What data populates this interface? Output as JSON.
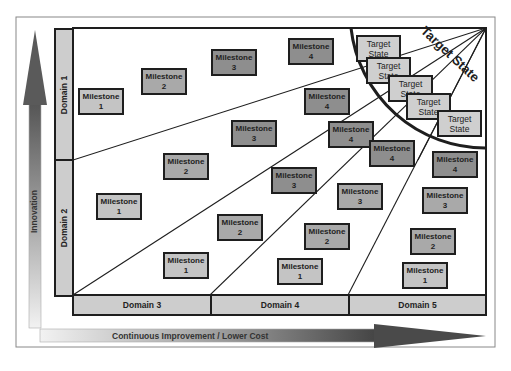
{
  "diagram": {
    "axes": {
      "vertical_label": "Innovation",
      "horizontal_label": "Continuous Improvement / Lower Cost"
    },
    "vertical_domains": [
      {
        "label": "Domain 1"
      },
      {
        "label": "Domain 2"
      }
    ],
    "horizontal_domains": [
      {
        "label": "Domain 3"
      },
      {
        "label": "Domain 4"
      },
      {
        "label": "Domain 5"
      }
    ],
    "target_region_label": "Target State",
    "target_states": [
      {
        "line1": "Target",
        "line2": "State"
      },
      {
        "line1": "Target",
        "line2": "State"
      },
      {
        "line1": "Target",
        "line2": "State"
      },
      {
        "line1": "Target",
        "line2": "State"
      },
      {
        "line1": "Target",
        "line2": "State"
      }
    ],
    "milestones": [
      {
        "label": "Milestone",
        "num": "1"
      },
      {
        "label": "Milestone",
        "num": "2"
      },
      {
        "label": "Milestone",
        "num": "3"
      },
      {
        "label": "Milestone",
        "num": "4"
      },
      {
        "label": "Milestone",
        "num": "4"
      },
      {
        "label": "Milestone",
        "num": "3"
      },
      {
        "label": "Milestone",
        "num": "4"
      },
      {
        "label": "Milestone",
        "num": "4"
      },
      {
        "label": "Milestone",
        "num": "2"
      },
      {
        "label": "Milestone",
        "num": "3"
      },
      {
        "label": "Milestone",
        "num": "3"
      },
      {
        "label": "Milestone",
        "num": "4"
      },
      {
        "label": "Milestone",
        "num": "1"
      },
      {
        "label": "Milestone",
        "num": "2"
      },
      {
        "label": "Milestone",
        "num": "2"
      },
      {
        "label": "Milestone",
        "num": "3"
      },
      {
        "label": "Milestone",
        "num": "2"
      },
      {
        "label": "Milestone",
        "num": "1"
      },
      {
        "label": "Milestone",
        "num": "1"
      },
      {
        "label": "Milestone",
        "num": "1"
      }
    ],
    "colors": {
      "milestone_1": "#c4c4c4",
      "milestone_2": "#b5b5b5",
      "milestone_3": "#a3a3a3",
      "milestone_4": "#8e8e8e",
      "target_state": "#cfcfcf",
      "domain_bar": "#cdcdcd",
      "border": "#1e1e1e"
    }
  }
}
